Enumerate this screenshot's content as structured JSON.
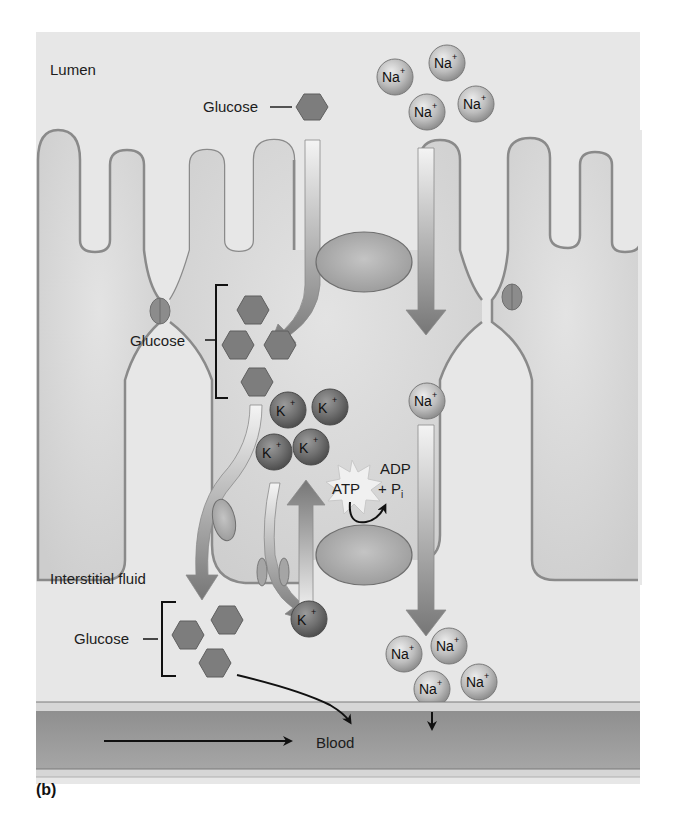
{
  "figure": {
    "panel_label": "(b)",
    "regions": {
      "lumen": "Lumen",
      "interstitial": "Interstitial fluid",
      "blood": "Blood"
    },
    "labels": {
      "glucose_lumen": "Glucose",
      "glucose_cell": "Glucose",
      "glucose_interstitial": "Glucose",
      "atp": "ATP",
      "adp": "ADP",
      "pi_plus": "+ P",
      "pi_sub": "i"
    },
    "ions": {
      "na": "Na",
      "k": "K",
      "charge": "+"
    },
    "colors": {
      "background": "#e6e6e6",
      "cell": "#dcdcdc",
      "membrane": "#8a8a8a",
      "glucose": "#7d7d7d",
      "na_ion": "#b9b9b9",
      "k_ion": "#6e6e6e",
      "arrow": "#7a7a7a",
      "blood": "#9a9a9a"
    }
  }
}
